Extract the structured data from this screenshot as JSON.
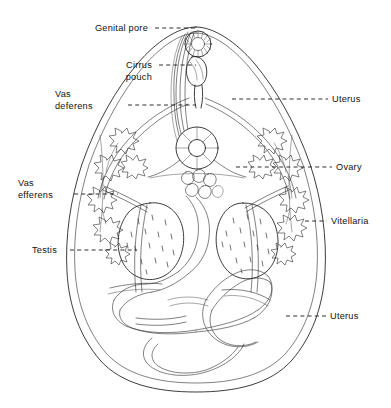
{
  "figure": {
    "organism_shape": "pear-shaped body outline",
    "background_color": "#ffffff",
    "ink_color": "#1a1a1a",
    "label_color": "#111111"
  },
  "labels": [
    {
      "id": "genital-pore",
      "name": "genital-pore",
      "text": "Genital pore",
      "lines": [
        "Genital pore"
      ],
      "side": "left",
      "text_x": 148,
      "text_y": 31,
      "leader": {
        "x1": 155,
        "y1": 28,
        "x2": 196,
        "y2": 28
      }
    },
    {
      "id": "cirrus-pouch",
      "name": "cirrus-pouch",
      "text": "Cirrus pouch",
      "lines": [
        "Cirrus",
        "pouch"
      ],
      "side": "left",
      "text_x": 152,
      "text_y": 68,
      "leader": {
        "x1": 159,
        "y1": 65,
        "x2": 196,
        "y2": 65
      }
    },
    {
      "id": "vas-deferens",
      "name": "vas-deferens",
      "text": "Vas deferens",
      "lines": [
        "Vas",
        "deferens"
      ],
      "side": "left",
      "text_x": 120,
      "text_y": 94,
      "leader": {
        "x1": 128,
        "y1": 105,
        "x2": 196,
        "y2": 105
      }
    },
    {
      "id": "uterus-upper",
      "name": "uterus-upper",
      "text": "Uterus",
      "lines": [
        "Uterus"
      ],
      "side": "right",
      "text_x": 332,
      "text_y": 102,
      "leader": {
        "x1": 232,
        "y1": 99,
        "x2": 328,
        "y2": 99
      }
    },
    {
      "id": "ovary",
      "name": "ovary",
      "text": "Ovary",
      "lines": [
        "Ovary",
        ""
      ],
      "side": "right",
      "text_x": 336,
      "text_y": 170,
      "leader": {
        "x1": 236,
        "y1": 167,
        "x2": 332,
        "y2": 167
      }
    },
    {
      "id": "vas-efferens",
      "name": "vas-efferens",
      "text": "Vas efferens",
      "lines": [
        "Vas",
        "efferens"
      ],
      "side": "left",
      "text_x": 18,
      "text_y": 183,
      "leader": {
        "x1": 74,
        "y1": 194,
        "x2": 118,
        "y2": 194
      }
    },
    {
      "id": "vitellaria",
      "name": "vitellaria",
      "text": "Vitellaria",
      "lines": [
        "Vitellaria"
      ],
      "side": "right",
      "text_x": 331,
      "text_y": 224,
      "leader": {
        "x1": 305,
        "y1": 221,
        "x2": 327,
        "y2": 221
      }
    },
    {
      "id": "testis",
      "name": "testis",
      "text": "Testis",
      "lines": [
        "Testis"
      ],
      "side": "left",
      "text_x": 32,
      "text_y": 253,
      "leader": {
        "x1": 70,
        "y1": 250,
        "x2": 137,
        "y2": 250
      }
    },
    {
      "id": "uterus-lower",
      "name": "uterus-lower",
      "text": "Uterus",
      "lines": [
        "Uterus"
      ],
      "side": "right",
      "text_x": 330,
      "text_y": 319,
      "leader": {
        "x1": 286,
        "y1": 316,
        "x2": 326,
        "y2": 316
      }
    }
  ],
  "structures": {
    "body_outline": "pear / teardrop shaped outer body wall with inner parallel margin line",
    "genital_pore": "radially striated rosette at anterior tip",
    "cirrus_pouch": "elongate sac below genital pore",
    "ovary": "annular donut shaped body at mid level",
    "testes": "two large stippled ovoid testes side by side",
    "vitellaria": "chains of branched follicle clusters along both lateral margins",
    "uterus": "broad coiled ribbon loops filling the posterior half"
  }
}
